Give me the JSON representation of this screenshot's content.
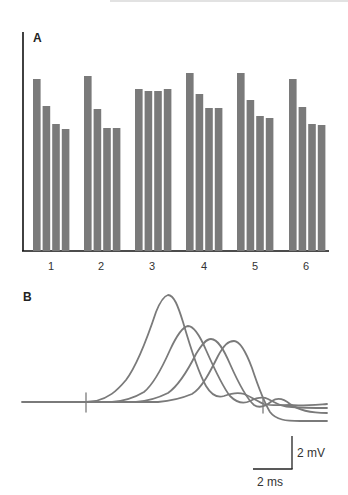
{
  "chart_data": [
    {
      "panel": "A",
      "type": "bar",
      "title": "",
      "xlabel": "",
      "ylabel": "",
      "categories": [
        "1",
        "2",
        "3",
        "4",
        "5",
        "6"
      ],
      "series": [
        {
          "name": "bar 1",
          "values": [
            172,
            175,
            162,
            178,
            178,
            172
          ]
        },
        {
          "name": "bar 2",
          "values": [
            145,
            142,
            160,
            157,
            151,
            144
          ]
        },
        {
          "name": "bar 3",
          "values": [
            127,
            123,
            160,
            143,
            135,
            127
          ]
        },
        {
          "name": "bar 4",
          "values": [
            122,
            123,
            162,
            143,
            133,
            126
          ]
        }
      ],
      "ylim": [
        0,
        220
      ],
      "grid": false,
      "legend": "none",
      "bar_color": "#7a7a7a",
      "note": "values are relative pixel heights; y-axis has no tick labels"
    },
    {
      "panel": "B",
      "type": "line",
      "title": "",
      "xlabel": "",
      "ylabel": "",
      "series": [
        {
          "name": "trace 1",
          "peak_time_ms": 4.3,
          "peak_amplitude_mV": 6.4,
          "onset_time_ms": 0.5
        },
        {
          "name": "trace 2",
          "peak_time_ms": 5.3,
          "peak_amplitude_mV": 4.6,
          "onset_time_ms": 1.6
        },
        {
          "name": "trace 3",
          "peak_time_ms": 6.5,
          "peak_amplitude_mV": 3.8,
          "onset_time_ms": 2.8
        },
        {
          "name": "trace 4",
          "peak_time_ms": 7.6,
          "peak_amplitude_mV": 3.7,
          "onset_time_ms": 3.8
        }
      ],
      "annotations": [
        "stimulus artifact at 0 ms"
      ],
      "scale_bars": {
        "vertical": "2 mV",
        "horizontal": "2 ms"
      },
      "line_color": "#7a7a7a"
    }
  ],
  "figure": {
    "panel_a_label": "A",
    "panel_b_label": "B",
    "x_tick_labels": [
      "1",
      "2",
      "3",
      "4",
      "5",
      "6"
    ],
    "scale_bar_voltage": "2 mV",
    "scale_bar_time": "2 ms"
  }
}
